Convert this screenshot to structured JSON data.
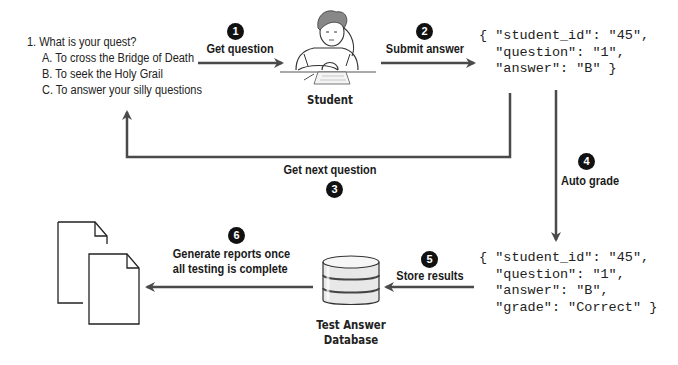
{
  "question": {
    "prompt": "1. What is your quest?",
    "options": [
      "A. To cross the Bridge of Death",
      "B. To seek the Holy Grail",
      "C. To answer your silly questions"
    ]
  },
  "actors": {
    "student": "Student",
    "database_line1": "Test Answer",
    "database_line2": "Database"
  },
  "steps": [
    {
      "number": "1",
      "label": "Get question"
    },
    {
      "number": "2",
      "label": "Submit answer"
    },
    {
      "number": "3",
      "label": "Get next question"
    },
    {
      "number": "4",
      "label": "Auto grade"
    },
    {
      "number": "5",
      "label": "Store results"
    },
    {
      "number": "6",
      "label_line1": "Generate reports once",
      "label_line2": "all testing is complete"
    }
  ],
  "submission_json": [
    "{ \"student_id\": \"45\",",
    "  \"question\": \"1\",",
    "  \"answer\": \"B\" }"
  ],
  "graded_json": [
    "{ \"student_id\": \"45\",",
    "  \"question\": \"1\",",
    "  \"answer\": \"B\",",
    "  \"grade\": \"Correct\" }"
  ],
  "colors": {
    "arrow": "#4a4a4a",
    "step_badge": "#111111",
    "text": "#1a1a1a"
  }
}
